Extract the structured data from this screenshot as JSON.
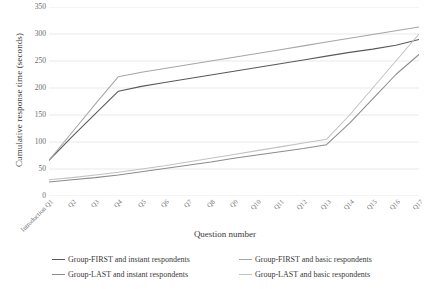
{
  "chart_data": {
    "type": "line",
    "title": "",
    "xlabel": "Question number",
    "ylabel": "Cumulative response time (seconds)",
    "ylim": [
      0,
      350
    ],
    "yticks": [
      0,
      50,
      100,
      150,
      200,
      250,
      300,
      350
    ],
    "ytick_labels": [
      "0",
      "50",
      "100",
      "150",
      "200",
      "250",
      "300",
      "350"
    ],
    "grid": "horizontal",
    "legend_position": "bottom",
    "categories": [
      "Introduction Q1",
      "Q2",
      "Q3",
      "Q4",
      "Q5",
      "Q6",
      "Q7",
      "Q8",
      "Q9",
      "Q10",
      "Q11",
      "Q12",
      "Q13",
      "Q14",
      "Q15",
      "Q16",
      "Q17"
    ],
    "series": [
      {
        "name": "Group-FIRST and instant respondents",
        "color": "#59595b",
        "values": [
          66,
          110,
          152,
          194,
          203,
          210,
          217,
          224,
          231,
          238,
          245,
          252,
          259,
          266,
          272,
          279,
          290
        ]
      },
      {
        "name": "Group-FIRST and basic respondents",
        "color": "#a6a6a8",
        "values": [
          66,
          118,
          170,
          221,
          229,
          236,
          243,
          250,
          257,
          264,
          271,
          278,
          285,
          292,
          299,
          306,
          313
        ]
      },
      {
        "name": "Group-LAST and instant respondents",
        "color": "#8c8c8e",
        "values": [
          26,
          30,
          34,
          39,
          45,
          51,
          57,
          63,
          70,
          76,
          82,
          88,
          95,
          135,
          180,
          225,
          262
        ]
      },
      {
        "name": "Group-LAST and basic respondents",
        "color": "#c2c2c4",
        "values": [
          30,
          34,
          39,
          44,
          50,
          56,
          63,
          70,
          77,
          84,
          91,
          98,
          105,
          150,
          200,
          250,
          300
        ]
      }
    ]
  },
  "legend": {
    "items": [
      "Group-FIRST and instant respondents",
      "Group-FIRST and basic respondents",
      "Group-LAST and instant respondents",
      "Group-LAST and basic respondents"
    ]
  },
  "colors": {
    "gridline": "#e6e6e6",
    "tick_text": "#6b6b6b",
    "axis_title": "#3a3a3a"
  }
}
